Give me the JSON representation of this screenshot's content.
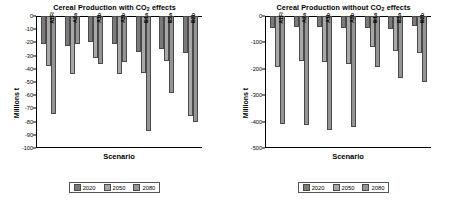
{
  "panels": [
    {
      "id": "with-co2",
      "title_prefix": "Cereal Production with CO",
      "title_sub": "2",
      "title_suffix": " effects",
      "xlabel": "Scenario",
      "ylabel": "Millions t",
      "yticks": [
        "0",
        "-10",
        "-20",
        "-30",
        "-40",
        "-50",
        "-60",
        "-70",
        "-80",
        "-90",
        "-100"
      ],
      "legend": [
        "2020",
        "2050",
        "2080"
      ],
      "chart_data": {
        "type": "bar",
        "title": "Cereal Production with CO2 effects",
        "xlabel": "Scenario",
        "ylabel": "Millions t",
        "ylim": [
          -100,
          0
        ],
        "ytick_step": 10,
        "grid": false,
        "legend_position": "bottom",
        "categories": [
          "A1FI",
          "A2a",
          "A1b",
          "A2b",
          "B1a",
          "B2a",
          "B2b"
        ],
        "series": [
          {
            "name": "2020",
            "values": [
              -21,
              -23,
              -20,
              -21,
              -27,
              -25,
              -28
            ]
          },
          {
            "name": "2050",
            "values": [
              -38,
              -44,
              -32,
              -44,
              -43,
              -34,
              -76
            ]
          },
          {
            "name": "2080",
            "values": [
              -74,
              -21,
              -36,
              -35,
              -87,
              -58,
              -80
            ]
          }
        ]
      }
    },
    {
      "id": "without-co2",
      "title_prefix": "Cereal Production without CO",
      "title_sub": "2",
      "title_suffix": " effects",
      "xlabel": "Scenario",
      "ylabel": "Millions t",
      "yticks": [
        "0",
        "-100",
        "-200",
        "-300",
        "-400",
        "-500"
      ],
      "legend": [
        "2020",
        "2050",
        "2080"
      ],
      "chart_data": {
        "type": "bar",
        "title": "Cereal Production without CO2 effects",
        "xlabel": "Scenario",
        "ylabel": "Millions t",
        "ylim": [
          -500,
          0
        ],
        "ytick_step": 100,
        "grid": false,
        "legend_position": "bottom",
        "categories": [
          "A1FI",
          "A2a",
          "A1b",
          "A2b",
          "B1a",
          "B2a",
          "B2b"
        ],
        "series": [
          {
            "name": "2020",
            "values": [
              -47,
              -43,
              -40,
              -44,
              -46,
              -48,
              -38
            ]
          },
          {
            "name": "2050",
            "values": [
              -193,
              -172,
              -174,
              -182,
              -117,
              -133,
              -142
            ]
          },
          {
            "name": "2080",
            "values": [
              -408,
              -413,
              -432,
              -421,
              -193,
              -236,
              -249
            ]
          }
        ]
      }
    }
  ],
  "colors": {
    "series_2020": "#7a7a7a",
    "series_2050": "#a8a8a8",
    "series_2080": "#949494",
    "axis": "#000000",
    "background": "#ffffff"
  }
}
